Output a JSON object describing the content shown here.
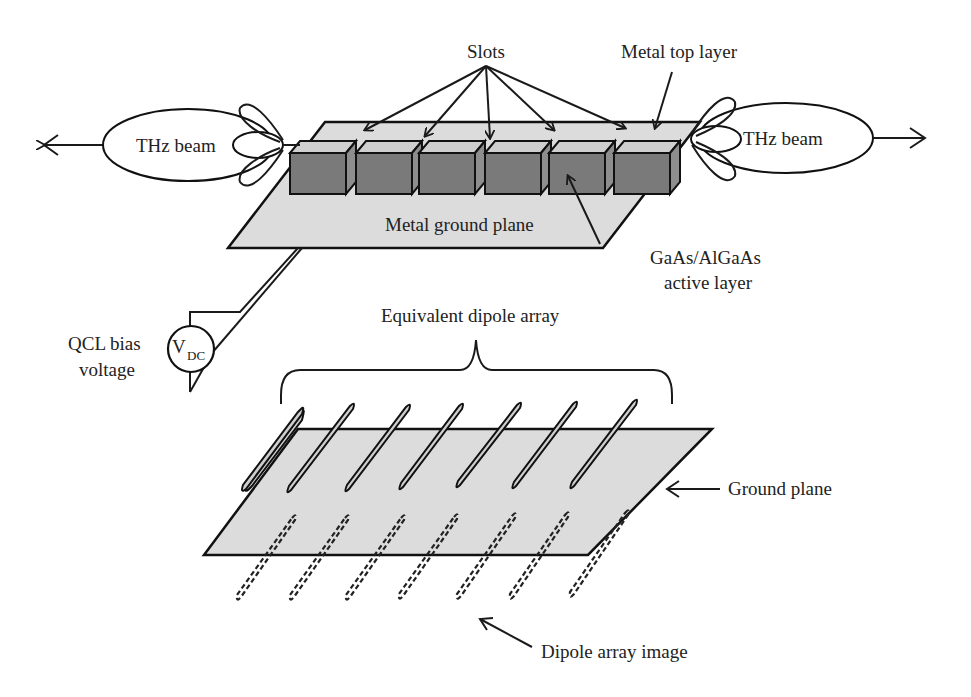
{
  "labels": {
    "slots": "Slots",
    "metal_top_layer": "Metal top layer",
    "thz_beam_left": "THz beam",
    "thz_beam_right": "THz beam",
    "metal_ground_plane": "Metal ground plane",
    "active_layer_line1": "GaAs/AlGaAs",
    "active_layer_line2": "active layer",
    "qcl_bias_line1": "QCL bias",
    "qcl_bias_line2": "voltage",
    "vdc_main": "V",
    "vdc_sub": "DC",
    "equivalent_dipole_array": "Equivalent dipole array",
    "ground_plane": "Ground plane",
    "dipole_array_image": "Dipole array image"
  },
  "counts": {
    "slot_blocks": 6,
    "dipoles": 7,
    "dipole_images": 7
  },
  "colors": {
    "block": "#7a7a7a",
    "plane": "#dcdcdc",
    "line": "#1a1a1a"
  }
}
